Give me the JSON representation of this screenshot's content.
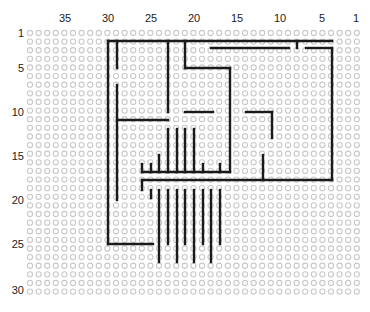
{
  "diagram": {
    "type": "stripboard-wire-layout",
    "grid": {
      "columns": 39,
      "rows": 31,
      "origin_x": 30,
      "origin_y": 33,
      "pitch_x": 8.6,
      "pitch_y": 8.62,
      "hole_color": "#c9c9c9",
      "wire_color": "#1a1a1a"
    },
    "column_labels": [
      {
        "text": "35",
        "x": 65
      },
      {
        "text": "30",
        "x": 108
      },
      {
        "text": "25",
        "x": 151
      },
      {
        "text": "20",
        "x": 194
      },
      {
        "text": "15",
        "x": 237
      },
      {
        "text": "10",
        "x": 280
      },
      {
        "text": "5",
        "x": 322
      },
      {
        "text": "1",
        "x": 356
      }
    ],
    "row_labels": [
      {
        "text": "1",
        "y": 33
      },
      {
        "text": "5",
        "y": 68
      },
      {
        "text": "10",
        "y": 112
      },
      {
        "text": "15",
        "y": 156
      },
      {
        "text": "20",
        "y": 200
      },
      {
        "text": "25",
        "y": 244
      },
      {
        "text": "30",
        "y": 290
      }
    ],
    "wires": [
      [
        [
          108,
          41
        ],
        [
          332,
          41
        ]
      ],
      [
        [
          108,
          41
        ],
        [
          108,
          244
        ]
      ],
      [
        [
          108,
          244
        ],
        [
          153,
          244
        ]
      ],
      [
        [
          117,
          41
        ],
        [
          117,
          68
        ]
      ],
      [
        [
          117,
          85
        ],
        [
          117,
          200
        ]
      ],
      [
        [
          117,
          120
        ],
        [
          168,
          120
        ]
      ],
      [
        [
          168,
          41
        ],
        [
          168,
          112
        ]
      ],
      [
        [
          185,
          41
        ],
        [
          185,
          68
        ]
      ],
      [
        [
          185,
          68
        ],
        [
          230,
          68
        ]
      ],
      [
        [
          230,
          68
        ],
        [
          230,
          172
        ]
      ],
      [
        [
          211,
          48
        ],
        [
          289,
          48
        ]
      ],
      [
        [
          297,
          41
        ],
        [
          297,
          48
        ]
      ],
      [
        [
          306,
          48
        ],
        [
          332,
          48
        ]
      ],
      [
        [
          332,
          48
        ],
        [
          332,
          180
        ]
      ],
      [
        [
          142,
          180
        ],
        [
          332,
          180
        ]
      ],
      [
        [
          142,
          180
        ],
        [
          142,
          190
        ]
      ],
      [
        [
          142,
          172
        ],
        [
          230,
          172
        ]
      ],
      [
        [
          142,
          164
        ],
        [
          142,
          172
        ]
      ],
      [
        [
          151,
          164
        ],
        [
          151,
          172
        ]
      ],
      [
        [
          159,
          155
        ],
        [
          159,
          172
        ]
      ],
      [
        [
          168,
          129
        ],
        [
          168,
          172
        ]
      ],
      [
        [
          177,
          129
        ],
        [
          177,
          172
        ]
      ],
      [
        [
          185,
          129
        ],
        [
          185,
          172
        ]
      ],
      [
        [
          185,
          112
        ],
        [
          213,
          112
        ]
      ],
      [
        [
          194,
          129
        ],
        [
          194,
          172
        ]
      ],
      [
        [
          203,
          164
        ],
        [
          203,
          172
        ]
      ],
      [
        [
          220,
          164
        ],
        [
          220,
          172
        ]
      ],
      [
        [
          246,
          112
        ],
        [
          272,
          112
        ]
      ],
      [
        [
          272,
          112
        ],
        [
          272,
          138
        ]
      ],
      [
        [
          263,
          155
        ],
        [
          263,
          180
        ]
      ],
      [
        [
          151,
          190
        ],
        [
          151,
          198
        ]
      ],
      [
        [
          159,
          190
        ],
        [
          159,
          262
        ]
      ],
      [
        [
          168,
          190
        ],
        [
          168,
          244
        ]
      ],
      [
        [
          177,
          190
        ],
        [
          177,
          262
        ]
      ],
      [
        [
          185,
          190
        ],
        [
          185,
          244
        ]
      ],
      [
        [
          194,
          190
        ],
        [
          194,
          262
        ]
      ],
      [
        [
          203,
          190
        ],
        [
          203,
          244
        ]
      ],
      [
        [
          211,
          190
        ],
        [
          211,
          262
        ]
      ],
      [
        [
          220,
          190
        ],
        [
          220,
          244
        ]
      ]
    ]
  }
}
